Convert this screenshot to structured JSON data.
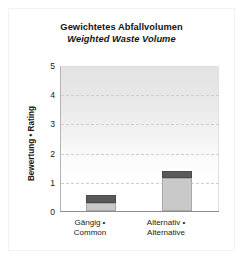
{
  "chart_data": {
    "type": "bar",
    "title": "Gewichtetes Abfallvolumen",
    "subtitle": "Weighted Waste Volume",
    "xlabel": "",
    "ylabel": "Bewertung • Rating",
    "ylim": [
      0,
      5
    ],
    "yticks": [
      "0",
      "1",
      "2",
      "3",
      "4",
      "5"
    ],
    "gridlines": [
      1,
      2,
      3,
      4
    ],
    "grid": true,
    "legend": false,
    "stacked": true,
    "categories": [
      "Gängig • Common",
      "Alternativ • Alternative"
    ],
    "series": [
      {
        "name": "lower-segment",
        "color": "#c9c9c9",
        "values": [
          0.27,
          1.13
        ]
      },
      {
        "name": "upper-segment",
        "color": "#595959",
        "values": [
          0.28,
          0.24
        ]
      }
    ],
    "totals": [
      0.55,
      1.37
    ]
  },
  "title_block": {
    "german": "Gewichtetes Abfallvolumen",
    "english": "Weighted Waste Volume"
  },
  "axes": {
    "y_title": "Bewertung • Rating",
    "y_tick_labels": [
      "5",
      "4",
      "3",
      "2",
      "1",
      "0"
    ],
    "x_categories": [
      {
        "line1": "Gängig •",
        "line2": "Common"
      },
      {
        "line1": "Alternativ •",
        "line2": "Alternative"
      }
    ]
  },
  "colors": {
    "segment_light": "#c9c9c9",
    "segment_dark": "#595959",
    "plot_background_top": "#e3e3e3",
    "plot_background_bottom": "#ffffff",
    "gridline": "#cfcfcf",
    "axis": "#8c8c8c",
    "text": "#141414"
  }
}
